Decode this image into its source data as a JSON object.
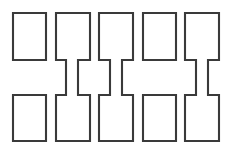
{
  "figure": {
    "background_color": "#ffffff",
    "stroke_color": "#3a3a3a",
    "fill_color": "#ffffff",
    "stroke_width": 2.1,
    "canvas": {
      "width": 231,
      "height": 165
    }
  },
  "chart_data": {
    "type": "diagram",
    "xlabel": "",
    "ylabel": "",
    "grid": false,
    "legend": false,
    "units_count": 5,
    "units": [
      {
        "index": 1,
        "name": "unit-1",
        "connected": false,
        "neck": null,
        "top_rect": {
          "x": 13,
          "y": 13,
          "width": 33,
          "height": 47
        },
        "bottom_rect": {
          "x": 13,
          "y": 95,
          "width": 33,
          "height": 46
        }
      },
      {
        "index": 2,
        "name": "unit-2",
        "connected": true,
        "neck": {
          "x": 66,
          "y": 60,
          "width": 12,
          "height": 35
        },
        "top_rect": {
          "x": 56,
          "y": 13,
          "width": 34,
          "height": 47
        },
        "bottom_rect": {
          "x": 56,
          "y": 95,
          "width": 34,
          "height": 46
        }
      },
      {
        "index": 3,
        "name": "unit-3",
        "connected": true,
        "neck": {
          "x": 110,
          "y": 60,
          "width": 12,
          "height": 35
        },
        "top_rect": {
          "x": 99,
          "y": 13,
          "width": 34,
          "height": 47
        },
        "bottom_rect": {
          "x": 99,
          "y": 95,
          "width": 34,
          "height": 46
        }
      },
      {
        "index": 4,
        "name": "unit-4",
        "connected": false,
        "neck": null,
        "top_rect": {
          "x": 143,
          "y": 13,
          "width": 33,
          "height": 47
        },
        "bottom_rect": {
          "x": 143,
          "y": 95,
          "width": 33,
          "height": 46
        }
      },
      {
        "index": 5,
        "name": "unit-5",
        "connected": true,
        "neck": {
          "x": 196,
          "y": 60,
          "width": 12,
          "height": 35
        },
        "top_rect": {
          "x": 185,
          "y": 13,
          "width": 34,
          "height": 47
        },
        "bottom_rect": {
          "x": 185,
          "y": 95,
          "width": 34,
          "height": 46
        }
      }
    ]
  }
}
